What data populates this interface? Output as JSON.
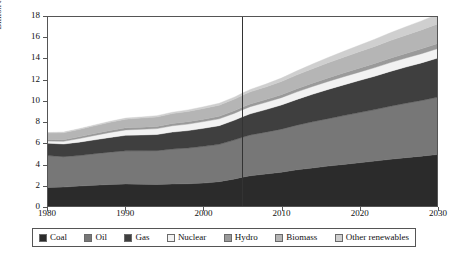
{
  "chart_data": {
    "type": "area",
    "title": "",
    "subtitle": "",
    "xlabel": "",
    "ylabel": "Billion tonnes of oil equivalent",
    "xlim": [
      1980,
      2030
    ],
    "ylim": [
      0,
      18
    ],
    "grid": false,
    "stacked": true,
    "legend_position": "bottom",
    "y_ticks": [
      0,
      2,
      4,
      6,
      8,
      10,
      12,
      14,
      16,
      18
    ],
    "x_ticks": [
      1980,
      1990,
      2000,
      2010,
      2020,
      2030
    ],
    "x_tick_labels": [
      "1980",
      "1990",
      "2000",
      "2010",
      "2020",
      "2030"
    ],
    "y_tick_labels": [
      "0",
      "2",
      "4",
      "6",
      "8",
      "10",
      "12",
      "14",
      "16",
      "18"
    ],
    "annotations": [
      {
        "name": "projection-divider",
        "type": "vline",
        "x": 2005,
        "label": ""
      }
    ],
    "x": [
      1980,
      1982,
      1984,
      1986,
      1988,
      1990,
      1992,
      1994,
      1996,
      1998,
      2000,
      2002,
      2004,
      2005,
      2006,
      2008,
      2010,
      2012,
      2014,
      2016,
      2018,
      2020,
      2022,
      2024,
      2026,
      2028,
      2030
    ],
    "series": [
      {
        "name": "Coal",
        "color": "#2b2b2b",
        "values": [
          1.75,
          1.8,
          1.9,
          1.98,
          2.05,
          2.1,
          2.08,
          2.05,
          2.1,
          2.12,
          2.18,
          2.32,
          2.58,
          2.75,
          2.88,
          3.05,
          3.22,
          3.45,
          3.62,
          3.8,
          3.96,
          4.12,
          4.28,
          4.45,
          4.6,
          4.75,
          4.9
        ]
      },
      {
        "name": "Oil",
        "color": "#777777",
        "values": [
          3.05,
          2.9,
          2.9,
          3.0,
          3.08,
          3.15,
          3.18,
          3.22,
          3.32,
          3.4,
          3.5,
          3.55,
          3.72,
          3.8,
          3.88,
          3.98,
          4.1,
          4.25,
          4.4,
          4.52,
          4.65,
          4.78,
          4.9,
          5.05,
          5.18,
          5.3,
          5.45
        ]
      },
      {
        "name": "Gas",
        "color": "#3f3f3f",
        "values": [
          1.18,
          1.2,
          1.28,
          1.32,
          1.4,
          1.48,
          1.5,
          1.54,
          1.62,
          1.66,
          1.72,
          1.78,
          1.88,
          1.95,
          2.02,
          2.15,
          2.3,
          2.45,
          2.62,
          2.78,
          2.92,
          3.05,
          3.18,
          3.32,
          3.45,
          3.58,
          3.72
        ]
      },
      {
        "name": "Nuclear",
        "color": "#f2f2f2",
        "values": [
          0.2,
          0.26,
          0.34,
          0.42,
          0.48,
          0.52,
          0.54,
          0.56,
          0.6,
          0.62,
          0.64,
          0.65,
          0.66,
          0.67,
          0.68,
          0.69,
          0.7,
          0.72,
          0.74,
          0.76,
          0.78,
          0.8,
          0.82,
          0.84,
          0.86,
          0.88,
          0.9
        ]
      },
      {
        "name": "Hydro",
        "color": "#9a9a9a",
        "values": [
          0.15,
          0.16,
          0.17,
          0.18,
          0.19,
          0.2,
          0.21,
          0.21,
          0.22,
          0.23,
          0.23,
          0.24,
          0.25,
          0.25,
          0.26,
          0.27,
          0.28,
          0.3,
          0.32,
          0.34,
          0.36,
          0.38,
          0.4,
          0.42,
          0.44,
          0.46,
          0.48
        ]
      },
      {
        "name": "Biomass",
        "color": "#b5b5b5",
        "values": [
          0.62,
          0.66,
          0.7,
          0.74,
          0.78,
          0.82,
          0.86,
          0.9,
          0.94,
          0.98,
          1.02,
          1.06,
          1.1,
          1.12,
          1.15,
          1.2,
          1.26,
          1.32,
          1.38,
          1.44,
          1.5,
          1.56,
          1.62,
          1.68,
          1.74,
          1.8,
          1.86
        ]
      },
      {
        "name": "Other renewables",
        "color": "#cfcfcf",
        "values": [
          0.05,
          0.06,
          0.07,
          0.08,
          0.09,
          0.1,
          0.11,
          0.12,
          0.13,
          0.14,
          0.16,
          0.18,
          0.2,
          0.21,
          0.23,
          0.27,
          0.32,
          0.38,
          0.44,
          0.5,
          0.56,
          0.62,
          0.68,
          0.74,
          0.8,
          0.86,
          0.92
        ]
      }
    ],
    "totals": {
      "1980": 7.0,
      "2005": 11.55,
      "2030": 18.23
    }
  },
  "legend": {
    "items": [
      {
        "label": "Coal",
        "color": "#2b2b2b"
      },
      {
        "label": "Oil",
        "color": "#777777"
      },
      {
        "label": "Gas",
        "color": "#3f3f3f"
      },
      {
        "label": "Nuclear",
        "color": "#f2f2f2"
      },
      {
        "label": "Hydro",
        "color": "#9a9a9a"
      },
      {
        "label": "Biomass",
        "color": "#b5b5b5"
      },
      {
        "label": "Other renewables",
        "color": "#cfcfcf"
      }
    ]
  },
  "colors": {
    "axis": "#555555",
    "text": "#111111",
    "background": "#ffffff",
    "divider": "#333333"
  }
}
